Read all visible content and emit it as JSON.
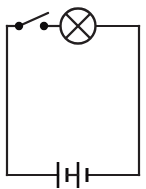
{
  "diagram": {
    "type": "electrical-schematic",
    "canvas": {
      "width": 146,
      "height": 189,
      "background_color": "#ffffff"
    },
    "style": {
      "line_color": "#231f20",
      "node_color": "#0f0d0e",
      "line_width": 2.2
    },
    "loop": {
      "label": "circuit loop",
      "left_x": 7,
      "right_x": 139,
      "top_y": 26,
      "bottom_y": 175
    },
    "components": [
      {
        "id": "switch",
        "label": "switch",
        "symbol": "open-switch",
        "state": "open",
        "terminal_left": {
          "x": 19,
          "y": 26,
          "r": 4.2
        },
        "terminal_right": {
          "x": 44,
          "y": 26,
          "r": 4.2
        },
        "lever": {
          "x1": 19,
          "y1": 26,
          "x2": 48,
          "y2": 13
        }
      },
      {
        "id": "lamp",
        "label": "lamp",
        "symbol": "crossed-circle",
        "center": {
          "x": 78,
          "y": 26
        },
        "radius": 17.5,
        "lead_left_x": 60,
        "lead_right_x": 96
      },
      {
        "id": "battery",
        "label": "battery",
        "symbol": "two-cell-battery",
        "cells": 2,
        "baseline_y": 175,
        "plates": [
          {
            "x": 58,
            "kind": "long",
            "half_height": 13
          },
          {
            "x": 67,
            "kind": "short",
            "half_height": 7
          },
          {
            "x": 78,
            "kind": "long",
            "half_height": 13
          },
          {
            "x": 87,
            "kind": "short",
            "half_height": 7
          }
        ],
        "gap_left_x": 58,
        "gap_right_x": 87
      }
    ]
  }
}
